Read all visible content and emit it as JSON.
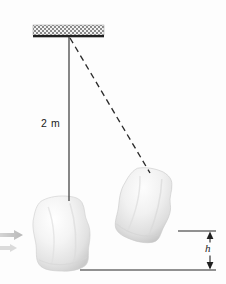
{
  "figure": {
    "background_color": "#fdfdfd",
    "line_color": "#262626",
    "width": 226,
    "height": 284
  },
  "labels": {
    "rod_length": "2 m",
    "rise_height": "h"
  },
  "ceiling": {
    "name": "hatched-support-bar",
    "x": 33,
    "y": 25,
    "width": 71,
    "height": 11,
    "hatch_color": "#8c8c8c",
    "edge_color": "#1c1c1c"
  },
  "pivot": {
    "x": 69,
    "y": 37
  },
  "rod": {
    "name": "vertical-rod",
    "x1": 69,
    "y1": 37,
    "x2": 69,
    "y2": 201,
    "stroke_width": 1.1
  },
  "dashed_rod": {
    "name": "swung-rod-dashed",
    "x1": 70,
    "y1": 38,
    "x2": 150,
    "y2": 172,
    "dash": "6 4",
    "stroke_width": 1.3
  },
  "bags": [
    {
      "name": "sandbag-at-rest",
      "cx": 62,
      "cy": 232,
      "rx": 27,
      "ry": 36,
      "rotation": -4,
      "fill_light": "#fbfbfb",
      "fill_mid": "#e6e6e6",
      "fill_shadow": "#cfcfcf"
    },
    {
      "name": "sandbag-swung",
      "cx": 146,
      "cy": 203,
      "rx": 25,
      "ry": 34,
      "rotation": 14,
      "fill_light": "#fafafa",
      "fill_mid": "#e4e4e4",
      "fill_shadow": "#cccccc"
    }
  ],
  "reference_lines": {
    "upper": {
      "name": "upper-reference-line",
      "x1": 178,
      "y1": 231,
      "x2": 216,
      "y2": 231
    },
    "lower": {
      "name": "lower-reference-line",
      "x1": 80,
      "y1": 270,
      "x2": 216,
      "y2": 270
    }
  },
  "height_arrow": {
    "name": "height-dimension-arrow",
    "x": 210,
    "y_top": 232,
    "y_bottom": 269
  },
  "velocity_arrow": {
    "name": "incoming-velocity-arrow",
    "x_tail": 0,
    "x_head": 22,
    "y": 241,
    "note": "faint arrow entering from left edge"
  }
}
